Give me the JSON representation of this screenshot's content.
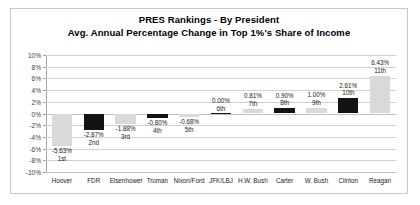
{
  "chart_data": {
    "type": "bar",
    "title": "PRES Rankings - By President",
    "subtitle": "Avg. Annual Percentage Change in Top 1%'s Share of Income",
    "xlabel": "",
    "ylabel": "",
    "ylim": [
      -10,
      10
    ],
    "ytick_step": 2,
    "grid": true,
    "legend": "none",
    "categories": [
      "Hoover",
      "FDR",
      "Eisenhower",
      "Truman",
      "Nixon/Ford",
      "JFK/LBJ",
      "H.W. Bush",
      "Carter",
      "W. Bush",
      "Clinton",
      "Reagan"
    ],
    "values": [
      -5.63,
      -2.87,
      -1.88,
      -0.8,
      -0.68,
      0.0,
      0.81,
      0.9,
      1.0,
      2.61,
      6.43
    ],
    "value_labels": [
      "-5.63%",
      "-2.87%",
      "-1.88%",
      "-0.80%",
      "-0.68%",
      "0.00%",
      "0.81%",
      "0.90%",
      "1.00%",
      "2.61%",
      "6.43%"
    ],
    "rank_labels": [
      "1st",
      "2nd",
      "3rd",
      "4th",
      "5th",
      "6th",
      "7th",
      "8th",
      "9th",
      "10th",
      "11th"
    ],
    "bar_colors": [
      "#d9d9d9",
      "#131313",
      "#d9d9d9",
      "#131313",
      "#d9d9d9",
      "#131313",
      "#d9d9d9",
      "#131313",
      "#d9d9d9",
      "#131313",
      "#d9d9d9"
    ],
    "ytick_labels": [
      "10%",
      "8%",
      "6%",
      "4%",
      "2%",
      "0%",
      "-2%",
      "-4%",
      "-6%",
      "-8%",
      "-10%"
    ],
    "ytick_values": [
      10,
      8,
      6,
      4,
      2,
      0,
      -2,
      -4,
      -6,
      -8,
      -10
    ]
  },
  "colors": {
    "bar_gray": "#d9d9d9",
    "bar_black": "#131313",
    "grid": "#d0d0d0",
    "frame": "#c8c8c8",
    "text": "#1a1a1a"
  }
}
